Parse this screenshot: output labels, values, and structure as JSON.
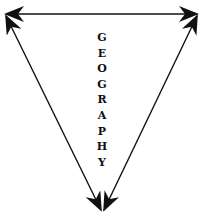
{
  "diagram": {
    "type": "inverted-triangle-of-double-headed-arrows",
    "label": "GEOGRAPHY",
    "letters": [
      "G",
      "E",
      "O",
      "G",
      "R",
      "A",
      "P",
      "H",
      "Y"
    ],
    "line_color": "#111111",
    "background": "#ffffff",
    "arrows": [
      {
        "name": "top-arrow",
        "from": [
          6,
          14
        ],
        "to": [
          197,
          14
        ],
        "heads": "both"
      },
      {
        "name": "left-arrow",
        "from": [
          6,
          14
        ],
        "to": [
          101,
          210
        ],
        "heads": "both"
      },
      {
        "name": "right-arrow",
        "from": [
          197,
          14
        ],
        "to": [
          104,
          210
        ],
        "heads": "both"
      }
    ]
  }
}
